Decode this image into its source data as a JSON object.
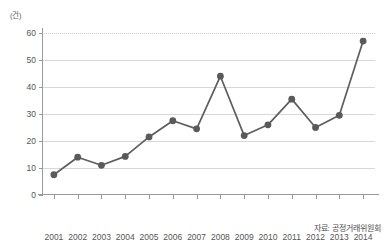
{
  "chart_data": {
    "type": "line",
    "title": "",
    "xlabel": "(년)",
    "ylabel": "(건)",
    "categories": [
      "2001",
      "2002",
      "2003",
      "2004",
      "2005",
      "2006",
      "2007",
      "2008",
      "2009",
      "2010",
      "2011",
      "2012",
      "2013",
      "2014"
    ],
    "values": [
      7.5,
      14,
      11,
      14.3,
      21.5,
      27.5,
      24.5,
      44,
      22,
      26,
      35.5,
      25,
      29.5,
      57
    ],
    "series": [
      {
        "name": "",
        "values": [
          7.5,
          14,
          11,
          14.3,
          21.5,
          27.5,
          24.5,
          44,
          22,
          26,
          35.5,
          25,
          29.5,
          57
        ]
      }
    ],
    "ylim": [
      0,
      60
    ],
    "yticks": [
      0,
      10,
      20,
      30,
      40,
      50,
      60
    ],
    "ytick_labels": [
      "0",
      "10",
      "20",
      "30",
      "40",
      "50",
      "60"
    ],
    "grid": true,
    "legend": "none",
    "line_color": "#5e5e5e",
    "marker_color": "#5a5a5a",
    "grid_color": "#d8d8d8",
    "axis_color": "#9a9a9a",
    "background": "#ffffff"
  },
  "axes": {
    "y_unit_label": "(건)",
    "x_unit_label": "(년)"
  },
  "footer": {
    "source": "자료: 공정거래위원회"
  }
}
